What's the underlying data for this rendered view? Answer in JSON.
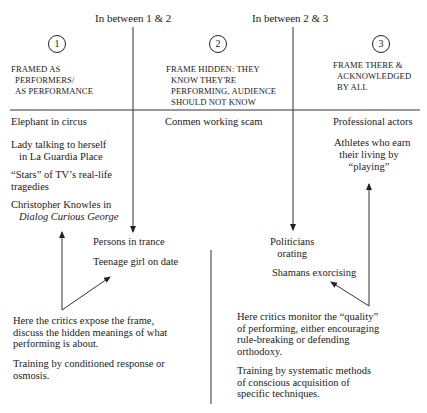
{
  "header": {
    "between_1_2": "In between 1 & 2",
    "between_2_3": "In between 2 & 3"
  },
  "columns": [
    {
      "number": "1",
      "heading_lines": [
        "FRAMED AS",
        "PERFORMERS/",
        "AS PERFORMANCE"
      ]
    },
    {
      "number": "2",
      "heading_lines": [
        "FRAME HIDDEN: THEY",
        "KNOW THEY'RE",
        "PERFORMING, AUDIENCE",
        "SHOULD NOT KNOW"
      ]
    },
    {
      "number": "3",
      "heading_lines": [
        "FRAME THERE &",
        "ACKNOWLEDGED",
        "BY ALL"
      ]
    }
  ],
  "left_items": {
    "elephant": "Elephant in circus",
    "lady_1": "Lady talking to herself",
    "lady_2": "in La Guardia Place",
    "stars_1": "“Stars” of TV’s real-life",
    "stars_2": "tragedies",
    "knowles_1": "Christopher Knowles in",
    "knowles_2": "Dialog Curious George"
  },
  "middle_items": {
    "conmen": "Conmen working scam",
    "trance": "Persons in trance",
    "teenage": "Teenage girl on date",
    "politicians_1": "Politicians",
    "politicians_2": "orating",
    "shamans": "Shamans exorcising"
  },
  "right_items": {
    "actors": "Professional actors",
    "athletes_1": "Athletes who earn",
    "athletes_2": "their living by",
    "athletes_3": "“playing”"
  },
  "notes": {
    "left": {
      "critics": [
        "Here the critics expose the frame,",
        "discuss the hidden meanings of what",
        "performing is about."
      ],
      "training": [
        "Training by conditioned response or",
        "osmosis."
      ]
    },
    "right": {
      "critics": [
        "Here critics monitor the “quality”",
        "of performing, either encouraging",
        "rule-breaking or defending",
        "orthodoxy."
      ],
      "training": [
        "Training by systematic methods",
        "of conscious acquisition of",
        "specific techniques."
      ]
    }
  },
  "colors": {
    "ink": "#1a1a1a",
    "line": "#333333",
    "background": "#ffffff"
  }
}
